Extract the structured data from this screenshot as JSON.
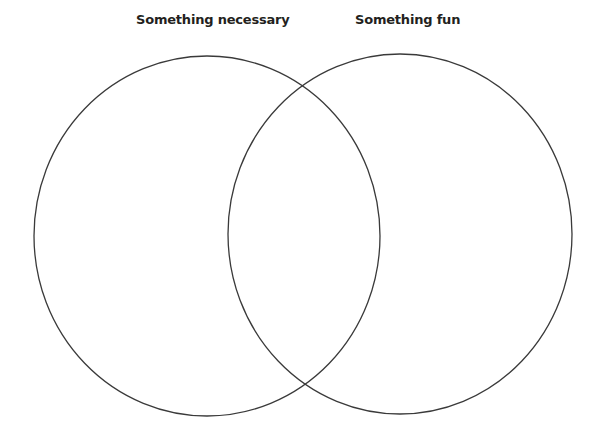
{
  "diagram": {
    "type": "venn",
    "sets": [
      {
        "label": "Something necessary",
        "cx": 207,
        "cy": 236,
        "rx": 173,
        "ry": 180
      },
      {
        "label": "Something fun",
        "cx": 400,
        "cy": 234,
        "rx": 172,
        "ry": 180
      }
    ],
    "stroke_color": "#3a3a3a",
    "background": "#ffffff"
  }
}
